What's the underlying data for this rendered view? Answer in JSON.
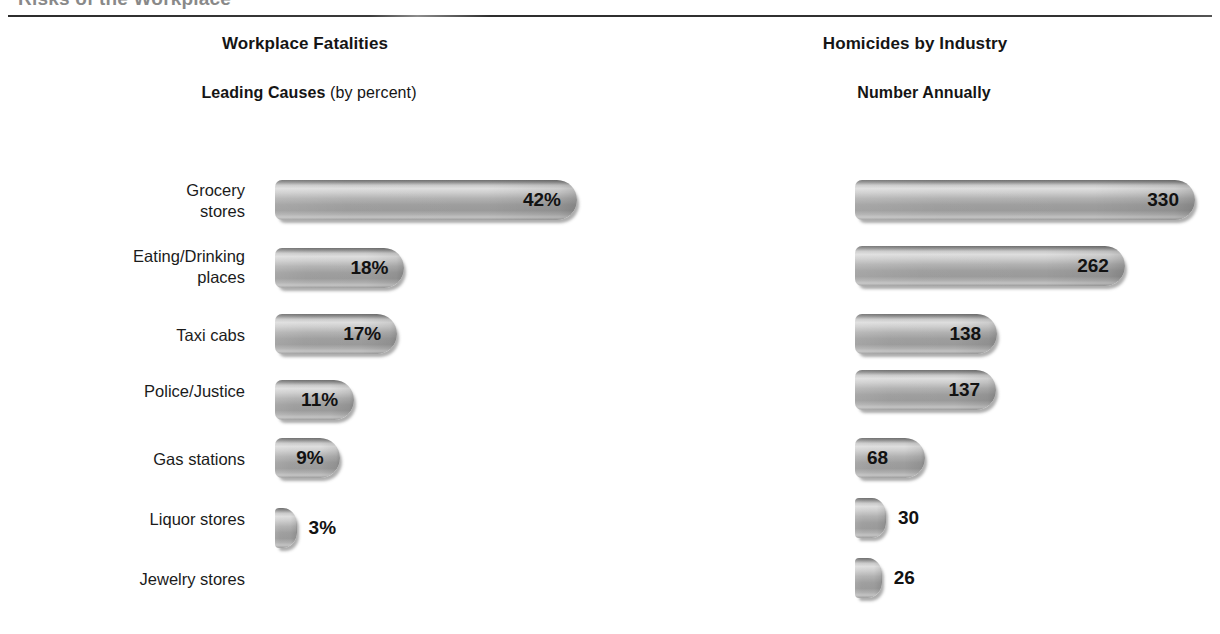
{
  "page": {
    "clipped_headline": "Risks of the Workplace",
    "footer_note": ""
  },
  "chart_data": [
    {
      "type": "bar",
      "orientation": "horizontal",
      "title": "Workplace Fatalities",
      "subtitle_strong": "Leading Causes",
      "subtitle_light": " (by percent)",
      "xlabel": "",
      "ylabel": "",
      "value_suffix": "%",
      "grid": false,
      "legend": "none",
      "xlim": [
        0,
        42
      ],
      "categories": [
        "Transportation\nIncidents",
        "Assaults and\nViolent Acts",
        "Contact with Objects\nand Equipment",
        "Falls",
        "Exposure to Harmful\nSubstances and\nEnvironments",
        "Fires and Explosions\nand Other"
      ],
      "values": [
        42,
        18,
        17,
        11,
        9,
        3
      ],
      "labels": [
        "42%",
        "18%",
        "17%",
        "11%",
        "9%",
        "3%"
      ],
      "label_placement": [
        "inside",
        "inside",
        "inside",
        "inside",
        "inside",
        "outside"
      ]
    },
    {
      "type": "bar",
      "orientation": "horizontal",
      "title": "Homicides by Industry",
      "subtitle_strong": "Number Annually",
      "subtitle_light": "",
      "xlabel": "",
      "ylabel": "",
      "value_suffix": "",
      "grid": false,
      "legend": "none",
      "xlim": [
        0,
        330
      ],
      "categories": [
        "Grocery\nstores",
        "Eating/Drinking\nplaces",
        "Taxi cabs",
        "Police/Justice",
        "Gas stations",
        "Liquor stores",
        "Jewelry stores"
      ],
      "values": [
        330,
        262,
        138,
        137,
        68,
        30,
        26
      ],
      "labels": [
        "330",
        "262",
        "138",
        "137",
        "68",
        "30",
        "26"
      ],
      "label_placement": [
        "inside",
        "inside",
        "inside",
        "inside",
        "inside-left",
        "outside",
        "outside"
      ]
    }
  ],
  "colors": {
    "bar_highlight": "#dedede",
    "bar_body": "#9e9e9e",
    "bar_edge": "#6f6f6f",
    "text": "#1b1b1b",
    "rule": "#2c2c2c",
    "background": "#ffffff"
  }
}
